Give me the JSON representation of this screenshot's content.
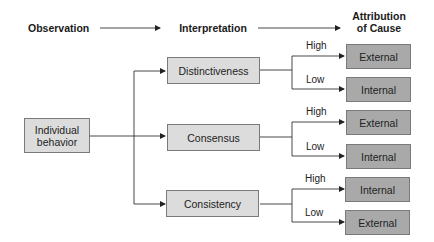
{
  "header": {
    "observation": "Observation",
    "interpretation": "Interpretation",
    "attribution_line1": "Attribution",
    "attribution_line2": "of Cause"
  },
  "observation_box": {
    "line1": "Individual",
    "line2": "behavior"
  },
  "interpretations": [
    {
      "label": "Distinctiveness",
      "high": {
        "branch": "High",
        "attribution": "External"
      },
      "low": {
        "branch": "Low",
        "attribution": "Internal"
      }
    },
    {
      "label": "Consensus",
      "high": {
        "branch": "High",
        "attribution": "External"
      },
      "low": {
        "branch": "Low",
        "attribution": "Internal"
      }
    },
    {
      "label": "Consistency",
      "high": {
        "branch": "High",
        "attribution": "Internal"
      },
      "low": {
        "branch": "Low",
        "attribution": "External"
      }
    }
  ],
  "colors": {
    "light_box": "#dcdcdc",
    "dark_box": "#a9a9a9",
    "border": "#7a7a7a",
    "line": "#333333"
  }
}
